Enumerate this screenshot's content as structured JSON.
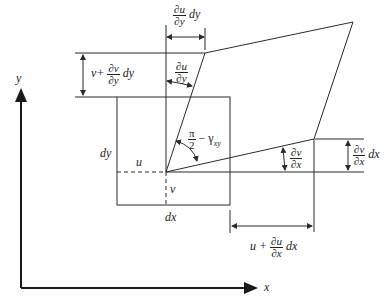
{
  "diagram": {
    "axes": {
      "x_label": "x",
      "y_label": "y"
    },
    "element": {
      "width_label": "dx",
      "height_label": "dy",
      "u_label": "u",
      "v_label": "v"
    },
    "labels": {
      "du_dy_dy": {
        "num": "∂u",
        "den": "∂y",
        "suffix": "dy"
      },
      "du_dy": {
        "num": "∂u",
        "den": "∂y"
      },
      "v_plus": {
        "prefix": "v+",
        "num": "∂v",
        "den": "∂y",
        "suffix": "dy"
      },
      "angle": {
        "num": "π",
        "den": "2",
        "suffix": "− γ",
        "sub": "xy"
      },
      "dv_dx": {
        "num": "∂v",
        "den": "∂x"
      },
      "dv_dx_dx": {
        "num": "∂v",
        "den": "∂x",
        "suffix": "dx"
      },
      "u_plus": {
        "prefix": "u +",
        "num": "∂u",
        "den": "∂x",
        "suffix": "dx"
      }
    },
    "colors": {
      "line": "#2b2b2b",
      "axis": "#1a1a1a",
      "background": "#ffffff"
    }
  }
}
